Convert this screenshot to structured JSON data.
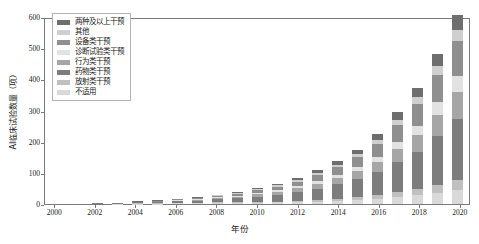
{
  "chart_data": {
    "type": "bar",
    "subtype": "stacked-bar",
    "title": "",
    "xlabel": "年份",
    "ylabel": "AI临床试验数量（项）",
    "ylim": [
      0,
      600
    ],
    "yticks": [
      0,
      100,
      200,
      300,
      400,
      500,
      600
    ],
    "grid": false,
    "legend_position": "top-left-inside",
    "categories": [
      "2000",
      "2001",
      "2002",
      "2003",
      "2004",
      "2005",
      "2006",
      "2007",
      "2008",
      "2009",
      "2010",
      "2011",
      "2012",
      "2013",
      "2014",
      "2015",
      "2016",
      "2017",
      "2018",
      "2019",
      "2020"
    ],
    "xtick_labels": [
      "2000",
      "2002",
      "2004",
      "2006",
      "2008",
      "2010",
      "2012",
      "2014",
      "2016",
      "2018",
      "2020"
    ],
    "series": [
      {
        "name": "不适用",
        "color": "#d9d9d9",
        "values": [
          0,
          0,
          0,
          1,
          1,
          1,
          2,
          2,
          3,
          3,
          4,
          5,
          6,
          8,
          10,
          13,
          16,
          22,
          28,
          36,
          44
        ]
      },
      {
        "name": "放射类干预",
        "color": "#c0c0c0",
        "values": [
          0,
          0,
          0,
          0,
          1,
          1,
          1,
          1,
          2,
          2,
          3,
          3,
          4,
          5,
          7,
          9,
          12,
          16,
          20,
          26,
          32
        ]
      },
      {
        "name": "药物类干预",
        "color": "#7d7d7d",
        "values": [
          1,
          1,
          2,
          2,
          3,
          4,
          6,
          8,
          10,
          13,
          17,
          22,
          28,
          36,
          46,
          58,
          74,
          96,
          120,
          155,
          196
        ]
      },
      {
        "name": "行为类干预",
        "color": "#a6a6a6",
        "values": [
          0,
          0,
          0,
          1,
          1,
          1,
          2,
          3,
          4,
          5,
          7,
          9,
          12,
          15,
          19,
          25,
          32,
          42,
          54,
          70,
          88
        ]
      },
      {
        "name": "诊断试验类干预",
        "color": "#e2e2e2",
        "values": [
          0,
          0,
          0,
          0,
          1,
          1,
          1,
          2,
          2,
          3,
          4,
          5,
          7,
          9,
          11,
          14,
          18,
          24,
          30,
          40,
          50
        ]
      },
      {
        "name": "设备类干预",
        "color": "#8f8f8f",
        "values": [
          0,
          0,
          1,
          1,
          1,
          2,
          3,
          4,
          5,
          7,
          9,
          12,
          15,
          20,
          25,
          32,
          41,
          54,
          68,
          88,
          112
        ]
      },
      {
        "name": "其他",
        "color": "#cfcfcf",
        "values": [
          0,
          0,
          0,
          0,
          0,
          1,
          1,
          1,
          2,
          2,
          3,
          4,
          5,
          6,
          8,
          10,
          13,
          17,
          22,
          28,
          36
        ]
      },
      {
        "name": "两种及以上干预",
        "color": "#6e6e6e",
        "values": [
          0,
          0,
          0,
          0,
          1,
          1,
          1,
          2,
          2,
          3,
          4,
          5,
          7,
          9,
          11,
          14,
          18,
          24,
          30,
          39,
          50
        ]
      }
    ],
    "totals": [
      1,
      1,
      3,
      5,
      9,
      12,
      17,
      23,
      30,
      38,
      51,
      65,
      84,
      108,
      137,
      175,
      224,
      295,
      372,
      482,
      608
    ]
  },
  "legend": {
    "items": [
      {
        "label": "两种及以上干预",
        "color": "#6e6e6e"
      },
      {
        "label": "其他",
        "color": "#cfcfcf"
      },
      {
        "label": "设备类干预",
        "color": "#8f8f8f"
      },
      {
        "label": "诊断试验类干预",
        "color": "#e2e2e2"
      },
      {
        "label": "行为类干预",
        "color": "#a6a6a6"
      },
      {
        "label": "药物类干预",
        "color": "#7d7d7d"
      },
      {
        "label": "放射类干预",
        "color": "#c0c0c0"
      },
      {
        "label": "不适用",
        "color": "#d9d9d9"
      }
    ]
  },
  "axes": {
    "y_title": "AI临床试验数量（项）",
    "x_title": "年份"
  },
  "style": {
    "frame_color": "#7a7a7a",
    "text_color": "#1a1a1a",
    "background": "#ffffff"
  }
}
